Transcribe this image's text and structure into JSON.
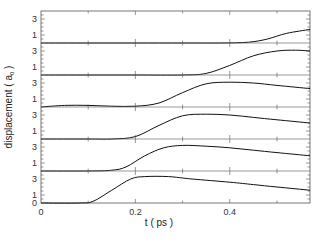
{
  "chart_data": {
    "type": "line",
    "layout": "stacked-panels",
    "xlabel": "t ( ps )",
    "ylabel": "displacement ( a 0 )",
    "ylabel_subscript": "0",
    "xlim": [
      0,
      0.57
    ],
    "x_ticks": [
      0,
      0.2,
      0.4
    ],
    "x_tick_labels": [
      "0",
      "0.2",
      "0.4"
    ],
    "x_minor_ticks": [
      0.1,
      0.3,
      0.5
    ],
    "panel_ylim": [
      0,
      4
    ],
    "panel_y_tick_labels": [
      "1",
      "3"
    ],
    "panel_y_ticks": [
      1,
      3
    ],
    "panel_y_minor_ticks": [
      0.5,
      1,
      1.5,
      2,
      2.5,
      3,
      3.5
    ],
    "bottom_panel_zero_label": "0",
    "grid": false,
    "legend": null,
    "series": [
      {
        "name": "panel-1 (top)",
        "x": [
          0,
          0.1,
          0.2,
          0.3,
          0.38,
          0.44,
          0.48,
          0.52,
          0.57
        ],
        "y": [
          0,
          0,
          0,
          0,
          0,
          0.1,
          0.5,
          1.2,
          1.7
        ]
      },
      {
        "name": "panel-2",
        "x": [
          0,
          0.1,
          0.2,
          0.3,
          0.35,
          0.4,
          0.45,
          0.5,
          0.54,
          0.57
        ],
        "y": [
          0,
          0,
          0,
          0,
          0.2,
          1.2,
          2.4,
          3.0,
          3.1,
          3.0
        ]
      },
      {
        "name": "panel-3",
        "x": [
          0,
          0.05,
          0.1,
          0.15,
          0.2,
          0.25,
          0.3,
          0.35,
          0.4,
          0.45,
          0.5,
          0.57
        ],
        "y": [
          0,
          0.2,
          0.2,
          0.1,
          0.1,
          0.5,
          1.8,
          2.9,
          3.1,
          3.0,
          2.7,
          2.3
        ]
      },
      {
        "name": "panel-4",
        "x": [
          0,
          0.1,
          0.15,
          0.2,
          0.25,
          0.3,
          0.35,
          0.4,
          0.45,
          0.5,
          0.57
        ],
        "y": [
          0,
          0,
          0,
          0.3,
          1.7,
          2.9,
          3.1,
          3.0,
          2.7,
          2.4,
          2.0
        ]
      },
      {
        "name": "panel-5",
        "x": [
          0,
          0.1,
          0.15,
          0.18,
          0.22,
          0.26,
          0.3,
          0.35,
          0.4,
          0.45,
          0.5,
          0.57
        ],
        "y": [
          0,
          0,
          0.1,
          0.5,
          1.9,
          2.9,
          3.2,
          3.1,
          2.9,
          2.6,
          2.3,
          1.9
        ]
      },
      {
        "name": "panel-6 (bottom)",
        "x": [
          0,
          0.08,
          0.11,
          0.15,
          0.19,
          0.22,
          0.27,
          0.32,
          0.4,
          0.45,
          0.5,
          0.57
        ],
        "y": [
          0,
          0,
          0.2,
          1.6,
          3.0,
          3.3,
          3.3,
          3.0,
          2.6,
          2.3,
          2.0,
          1.6
        ]
      }
    ]
  },
  "style": {
    "line_color": "#111111",
    "axis_color": "#555555",
    "background": "#ffffff"
  }
}
